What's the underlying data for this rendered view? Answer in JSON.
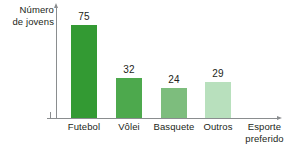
{
  "chart_data": {
    "type": "bar",
    "title": "",
    "xlabel": "Esporte preferido",
    "ylabel": "Número de jovens",
    "categories": [
      "Futebol",
      "Vôlei",
      "Basquete",
      "Outros"
    ],
    "values": [
      75,
      32,
      24,
      29
    ],
    "value_labels": [
      "75",
      "32",
      "24",
      "29"
    ],
    "colors": [
      "#339a33",
      "#4da94d",
      "#7dbd7d",
      "#b8e0bd"
    ],
    "grid": false,
    "legend": null,
    "ylim": [
      0,
      90
    ],
    "axis_color": "#8a8d8f"
  },
  "ylabel_lines": {
    "line1": "Número",
    "line2": "de jovens"
  },
  "xlabel_lines": {
    "line1": "Esporte",
    "line2": "preferido"
  }
}
